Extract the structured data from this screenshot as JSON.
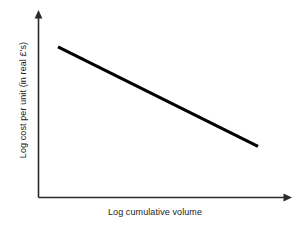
{
  "chart_data": {
    "type": "line",
    "title": "",
    "subtitle": "",
    "xlabel": "Log cumulative volume",
    "ylabel": "Log cost per unit (in real £'s)",
    "xlim": [
      0,
      1
    ],
    "ylim": [
      0,
      1
    ],
    "grid": false,
    "legend": false,
    "legend_position": "none",
    "xticks": [],
    "yticks": [],
    "xticklabels": [],
    "yticklabels": [],
    "annotations": [],
    "series": [
      {
        "name": "Experience curve",
        "x": [
          0.0794,
          0.873
        ],
        "y": [
          0.8118,
          0.2742
        ],
        "values": [
          0.8118,
          0.2742
        ],
        "color": "#000000",
        "linewidth": 3,
        "style": "solid",
        "markers": false
      }
    ]
  },
  "axes": {
    "x_axis": {
      "name": "x-axis",
      "color": "#2b2b2b",
      "arrow": "right",
      "start_px": [
        38,
        197
      ],
      "end_px": [
        290,
        197
      ]
    },
    "y_axis": {
      "name": "y-axis",
      "color": "#2b2b2b",
      "arrow": "up",
      "start_px": [
        38,
        197
      ],
      "end_px": [
        38,
        12
      ]
    }
  },
  "canvas": {
    "width": 304,
    "height": 228,
    "background": "#ffffff"
  }
}
